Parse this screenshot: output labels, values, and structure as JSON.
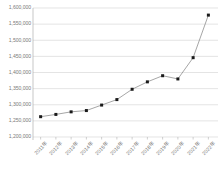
{
  "chart_data": {
    "type": "line",
    "title": "",
    "subtitle": "",
    "xlabel": "",
    "ylabel": "",
    "categories": [
      "2011年",
      "2012年",
      "2013年",
      "2014年",
      "2015年",
      "2016年",
      "2017年",
      "2018年",
      "2019年",
      "2020年",
      "2021年",
      "2022年"
    ],
    "values": [
      1263000,
      1270000,
      1278000,
      1282000,
      1299000,
      1316000,
      1348000,
      1371000,
      1390000,
      1380000,
      1446000,
      1578000
    ],
    "series": [
      {
        "name": "",
        "values": [
          1263000,
          1270000,
          1278000,
          1282000,
          1299000,
          1316000,
          1348000,
          1371000,
          1390000,
          1380000,
          1446000,
          1578000
        ]
      }
    ],
    "ylim": [
      1200000,
      1600000
    ],
    "ytick_values": [
      1200000,
      1250000,
      1300000,
      1350000,
      1400000,
      1450000,
      1500000,
      1550000,
      1600000
    ],
    "ytick_labels": [
      "1,200,000",
      "1,250,000",
      "1,300,000",
      "1,350,000",
      "1,400,000",
      "1,450,000",
      "1,500,000",
      "1,550,000",
      "1,600,000"
    ],
    "grid": true,
    "grid_axis": "y",
    "legend": false,
    "legend_position": "none",
    "marker": "square",
    "line_color": "#808080",
    "marker_color": "#1a1a1a",
    "grid_color": "#d9d9d9",
    "axis_color": "#b0b0b0",
    "tick_label_color": "#7a7a7a",
    "background_color": "#ffffff"
  },
  "layout": {
    "plot_left": 33,
    "plot_right": 216,
    "plot_top": 8,
    "plot_bottom": 137
  }
}
